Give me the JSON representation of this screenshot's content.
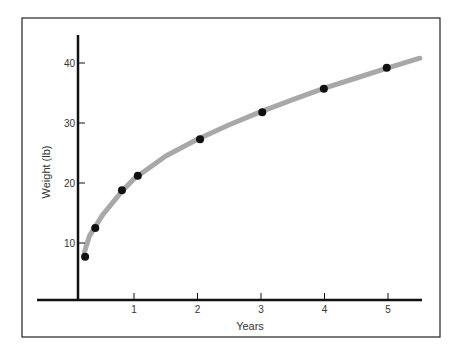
{
  "chart_data": {
    "type": "line",
    "title": "",
    "xlabel": "Years",
    "ylabel": "Weight (lb)",
    "x_ticks": [
      "1",
      "2",
      "3",
      "4",
      "5"
    ],
    "y_ticks": [
      "10",
      "20",
      "30",
      "40"
    ],
    "xlim": [
      0,
      5.5
    ],
    "ylim": [
      0,
      45
    ],
    "grid": false,
    "legend": null,
    "series": [
      {
        "name": "measured weight",
        "style": "scatter",
        "x": [
          0.23,
          0.39,
          0.81,
          1.06,
          2.04,
          3.02,
          3.99,
          4.98
        ],
        "y": [
          7.7,
          12.5,
          18.8,
          21.2,
          27.3,
          31.8,
          35.7,
          39.2
        ]
      },
      {
        "name": "fitted curve",
        "style": "line",
        "x": [
          0.22,
          0.3,
          0.5,
          0.8,
          1.0,
          1.5,
          2.0,
          2.5,
          3.0,
          3.5,
          4.0,
          4.5,
          5.0,
          5.5
        ],
        "y": [
          8.5,
          11.2,
          14.6,
          18.5,
          20.7,
          24.5,
          27.3,
          29.7,
          31.9,
          33.9,
          35.8,
          37.5,
          39.2,
          40.8
        ]
      }
    ]
  },
  "colors": {
    "curve": "#a8a8a8",
    "points": "#111111",
    "axes": "#111111",
    "frame": "#222222"
  }
}
